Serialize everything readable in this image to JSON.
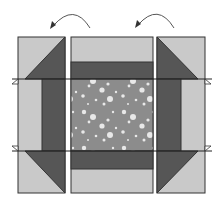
{
  "diagram": {
    "colors": {
      "background": "#ffffff",
      "light_fabric": "#c9c9c9",
      "dark_fabric": "#565656",
      "center_fabric": "#8c8c8c",
      "dots": "#e6e6e6",
      "outline": "#333333",
      "arrow": "#555555"
    },
    "units": [
      {
        "id": "left-side-unit",
        "role": "side unit (rotated)",
        "x": 18,
        "y": 37,
        "w": 47,
        "h": 156
      },
      {
        "id": "center-unit",
        "role": "center unit with border strips",
        "x": 71,
        "y": 37,
        "w": 82,
        "h": 156
      },
      {
        "id": "right-side-unit",
        "role": "side unit (rotated)",
        "x": 157,
        "y": 37,
        "w": 48,
        "h": 156
      }
    ],
    "arrows": [
      {
        "id": "rotate-left-arrow",
        "direction": "counter-clockwise",
        "from": [
          90,
          28
        ],
        "to": [
          52,
          28
        ]
      },
      {
        "id": "rotate-right-arrow",
        "direction": "counter-clockwise",
        "from": [
          174,
          28
        ],
        "to": [
          137,
          27
        ]
      }
    ],
    "seam_lines": [
      {
        "id": "top-seam",
        "y": 79,
        "x1": 12,
        "x2": 212
      },
      {
        "id": "bottom-seam",
        "y": 151,
        "x1": 12,
        "x2": 212
      }
    ]
  }
}
